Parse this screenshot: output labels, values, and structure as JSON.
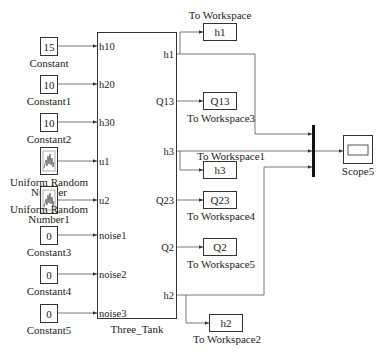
{
  "diagram": {
    "subsystem": {
      "name": "Three_Tank",
      "inputs": [
        "h10",
        "h20",
        "h30",
        "u1",
        "u2",
        "noise1",
        "noise2",
        "noise3"
      ],
      "outputs": [
        "h1",
        "Q13",
        "h3",
        "Q23",
        "Q2",
        "h2"
      ]
    },
    "sources": [
      {
        "type": "constant",
        "value": "15",
        "label": "Constant"
      },
      {
        "type": "constant",
        "value": "10",
        "label": "Constant1"
      },
      {
        "type": "constant",
        "value": "10",
        "label": "Constant2"
      },
      {
        "type": "uniform-random",
        "value": "",
        "label_line1": "Uniform Random",
        "label_line2": "Number"
      },
      {
        "type": "uniform-random",
        "value": "",
        "label_line1": "Uniform Random",
        "label_line2": "Number1"
      },
      {
        "type": "constant",
        "value": "0",
        "label": "Constant3"
      },
      {
        "type": "constant",
        "value": "0",
        "label": "Constant4"
      },
      {
        "type": "constant",
        "value": "0",
        "label": "Constant5"
      }
    ],
    "sinks": [
      {
        "var": "h1",
        "label": "To Workspace"
      },
      {
        "var": "Q13",
        "label": "To Workspace3"
      },
      {
        "var": "h3",
        "label": "To Workspace1"
      },
      {
        "var": "Q23",
        "label": "To Workspace4"
      },
      {
        "var": "Q2",
        "label": "To Workspace5"
      },
      {
        "var": "h2",
        "label": "To Workspace2"
      }
    ],
    "mux": {
      "inputs": 3
    },
    "scope": {
      "label": "Scope5"
    }
  }
}
